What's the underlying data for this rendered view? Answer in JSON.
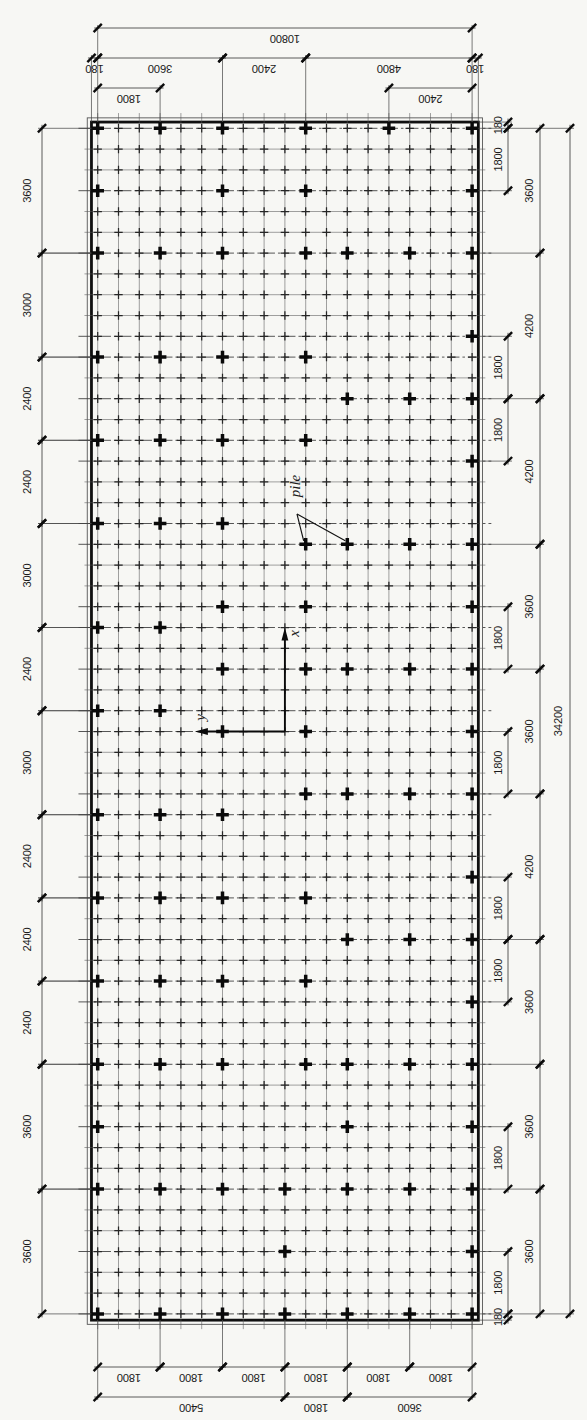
{
  "figure": {
    "kind": "pile-foundation-layout-plan",
    "callout": {
      "label": "pile",
      "targets": [
        [
          10,
          20
        ],
        [
          12,
          20
        ]
      ],
      "text_pos": [
        295,
        486
      ],
      "fork": [
        297,
        514
      ]
    },
    "axes": {
      "x_label": "x",
      "y_label": "y",
      "origin_col": 9,
      "origin_row": 29
    },
    "mesh": {
      "cols": 19,
      "rows": 58,
      "spacing_units": 600
    },
    "overall": {
      "top": "10800",
      "right": "34200"
    },
    "dims_top": [
      {
        "y": 28,
        "segs": [
          [
            0,
            18,
            "10800"
          ]
        ]
      },
      {
        "y": 58,
        "segs": [
          [
            -0.3,
            0,
            "180"
          ],
          [
            0,
            6,
            "3600"
          ],
          [
            6,
            10,
            "2400"
          ],
          [
            10,
            18,
            "4800"
          ],
          [
            18,
            18.3,
            "180"
          ]
        ]
      },
      {
        "y": 88,
        "segs": [
          [
            0,
            3,
            "1800"
          ],
          [
            14,
            18,
            "2400"
          ]
        ]
      }
    ],
    "dims_bottom": [
      {
        "y": 1367,
        "segs": [
          [
            0,
            3,
            "1800"
          ],
          [
            3,
            6,
            "1800"
          ],
          [
            6,
            9,
            "1800"
          ],
          [
            9,
            12,
            "1800"
          ],
          [
            12,
            15,
            "1800"
          ],
          [
            15,
            18,
            "1800"
          ]
        ]
      },
      {
        "y": 1397,
        "segs": [
          [
            0,
            9,
            "5400"
          ],
          [
            9,
            12,
            "1800"
          ],
          [
            12,
            18,
            "3600"
          ]
        ]
      }
    ],
    "dims_left": {
      "x": 42,
      "label_x": 27,
      "segs": [
        [
          0,
          6,
          "3600"
        ],
        [
          6,
          11,
          "3000"
        ],
        [
          11,
          15,
          "2400"
        ],
        [
          15,
          19,
          "2400"
        ],
        [
          19,
          24,
          "3000"
        ],
        [
          24,
          28,
          "2400"
        ],
        [
          28,
          33,
          "3000"
        ],
        [
          33,
          37,
          "2400"
        ],
        [
          37,
          41,
          "2400"
        ],
        [
          41,
          45,
          "2400"
        ],
        [
          45,
          51,
          "3600"
        ],
        [
          51,
          57,
          "3600"
        ]
      ]
    },
    "dims_right_inner": {
      "x": 508,
      "label_x": 498,
      "segs": [
        [
          -0.3,
          0,
          "180"
        ],
        [
          0,
          3,
          "1800"
        ],
        [
          10,
          13,
          "1800"
        ],
        [
          13,
          16,
          "1800"
        ],
        [
          23,
          26,
          "1800"
        ],
        [
          29,
          32,
          "1800"
        ],
        [
          36,
          39,
          "1800"
        ],
        [
          39,
          42,
          "1800"
        ],
        [
          48,
          51,
          "1800"
        ],
        [
          54,
          57,
          "1800"
        ],
        [
          57,
          57.3,
          "180"
        ]
      ]
    },
    "dims_right_outer": {
      "x": 540,
      "label_x": 529,
      "segs": [
        [
          0,
          6,
          "3600"
        ],
        [
          6,
          13,
          "4200"
        ],
        [
          13,
          20,
          "4200"
        ],
        [
          20,
          26,
          "3600"
        ],
        [
          26,
          32,
          "3600"
        ],
        [
          32,
          39,
          "4200"
        ],
        [
          39,
          45,
          "3600"
        ],
        [
          45,
          51,
          "3600"
        ],
        [
          51,
          57,
          "3600"
        ]
      ]
    },
    "dims_right_overall": {
      "x": 570,
      "label_x": 558,
      "segs": [
        [
          0,
          57,
          "34200"
        ]
      ]
    },
    "piles": [
      [
        0,
        0
      ],
      [
        3,
        0
      ],
      [
        6,
        0
      ],
      [
        10,
        0
      ],
      [
        14,
        0
      ],
      [
        18,
        0
      ],
      [
        0,
        3
      ],
      [
        6,
        3
      ],
      [
        10,
        3
      ],
      [
        18,
        3
      ],
      [
        0,
        6
      ],
      [
        3,
        6
      ],
      [
        6,
        6
      ],
      [
        10,
        6
      ],
      [
        12,
        6
      ],
      [
        15,
        6
      ],
      [
        18,
        6
      ],
      [
        18,
        10
      ],
      [
        0,
        11
      ],
      [
        3,
        11
      ],
      [
        6,
        11
      ],
      [
        10,
        11
      ],
      [
        12,
        13
      ],
      [
        15,
        13
      ],
      [
        18,
        13
      ],
      [
        0,
        15
      ],
      [
        3,
        15
      ],
      [
        6,
        15
      ],
      [
        10,
        15
      ],
      [
        18,
        16
      ],
      [
        0,
        19
      ],
      [
        3,
        19
      ],
      [
        6,
        19
      ],
      [
        10,
        20
      ],
      [
        12,
        20
      ],
      [
        15,
        20
      ],
      [
        18,
        20
      ],
      [
        6,
        23
      ],
      [
        10,
        23
      ],
      [
        18,
        23
      ],
      [
        0,
        24
      ],
      [
        3,
        24
      ],
      [
        6,
        26
      ],
      [
        10,
        26
      ],
      [
        12,
        26
      ],
      [
        15,
        26
      ],
      [
        18,
        26
      ],
      [
        0,
        28
      ],
      [
        3,
        28
      ],
      [
        6,
        29
      ],
      [
        10,
        29
      ],
      [
        18,
        29
      ],
      [
        10,
        32
      ],
      [
        12,
        32
      ],
      [
        15,
        32
      ],
      [
        18,
        32
      ],
      [
        0,
        33
      ],
      [
        3,
        33
      ],
      [
        6,
        33
      ],
      [
        18,
        36
      ],
      [
        0,
        37
      ],
      [
        3,
        37
      ],
      [
        6,
        37
      ],
      [
        10,
        37
      ],
      [
        12,
        39
      ],
      [
        15,
        39
      ],
      [
        18,
        39
      ],
      [
        0,
        41
      ],
      [
        3,
        41
      ],
      [
        6,
        41
      ],
      [
        10,
        41
      ],
      [
        18,
        42
      ],
      [
        0,
        45
      ],
      [
        3,
        45
      ],
      [
        6,
        45
      ],
      [
        10,
        45
      ],
      [
        12,
        45
      ],
      [
        15,
        45
      ],
      [
        18,
        45
      ],
      [
        0,
        48
      ],
      [
        12,
        48
      ],
      [
        18,
        48
      ],
      [
        0,
        51
      ],
      [
        3,
        51
      ],
      [
        6,
        51
      ],
      [
        9,
        51
      ],
      [
        12,
        51
      ],
      [
        15,
        51
      ],
      [
        18,
        51
      ],
      [
        9,
        54
      ],
      [
        18,
        54
      ],
      [
        0,
        57
      ],
      [
        3,
        57
      ],
      [
        6,
        57
      ],
      [
        9,
        57
      ],
      [
        12,
        57
      ],
      [
        15,
        57
      ],
      [
        18,
        57
      ]
    ]
  }
}
